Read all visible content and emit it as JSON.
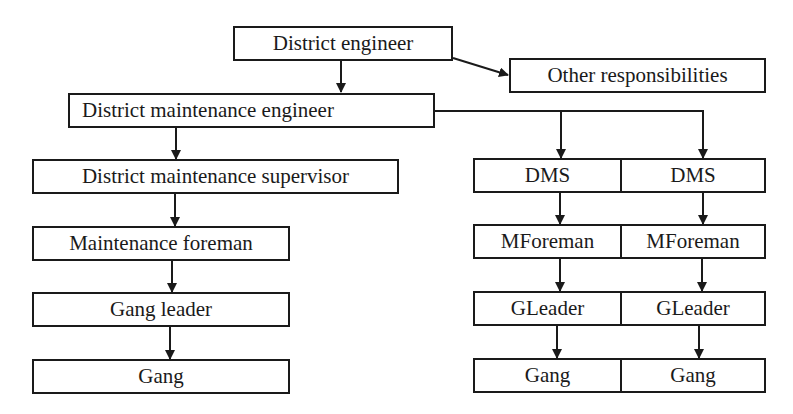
{
  "diagram": {
    "type": "organization-chart",
    "top": {
      "district_engineer": "District engineer",
      "other_responsibilities": "Other responsibilities",
      "district_maintenance_engineer": "District maintenance engineer"
    },
    "left_chain": [
      "District maintenance supervisor",
      "Maintenance foreman",
      "Gang leader",
      "Gang"
    ],
    "right_columns": [
      {
        "dms": "DMS",
        "foreman": "MForeman",
        "leader": "GLeader",
        "gang": "Gang"
      },
      {
        "dms": "DMS",
        "foreman": "MForeman",
        "leader": "GLeader",
        "gang": "Gang"
      }
    ],
    "colors": {
      "stroke": "#1a1a1a",
      "background": "#ffffff"
    }
  }
}
